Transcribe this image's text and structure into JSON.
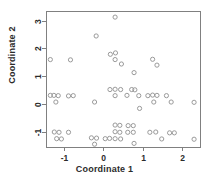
{
  "chart_data": {
    "type": "scatter",
    "title": "",
    "xlabel": "Coordinate 1",
    "ylabel": "Coordinate 2",
    "xlim": [
      -1.45,
      2.45
    ],
    "ylim": [
      -1.55,
      3.35
    ],
    "xticks": [
      -1,
      0,
      1,
      2
    ],
    "xticklabels": [
      "-1",
      "0",
      "1",
      "2"
    ],
    "yticks": [
      -1,
      0,
      1,
      2,
      3
    ],
    "yticklabels": [
      "-1",
      "0",
      "1",
      "2",
      "3"
    ],
    "grid": false,
    "legend": null,
    "marker": "open-circle",
    "marker_color": "#9a9a9a",
    "n_points": 61,
    "points": [
      [
        0.3,
        3.13
      ],
      [
        -0.18,
        2.45
      ],
      [
        0.18,
        1.79
      ],
      [
        0.31,
        1.84
      ],
      [
        0.3,
        1.6
      ],
      [
        0.46,
        1.44
      ],
      [
        -1.34,
        1.6
      ],
      [
        -0.83,
        1.59
      ],
      [
        1.25,
        1.61
      ],
      [
        1.36,
        1.4
      ],
      [
        0.78,
        1.13
      ],
      [
        0.3,
        0.53
      ],
      [
        0.44,
        0.52
      ],
      [
        0.3,
        0.3
      ],
      [
        0.72,
        0.52
      ],
      [
        0.8,
        0.51
      ],
      [
        0.9,
        0.3
      ],
      [
        1.25,
        0.32
      ],
      [
        1.36,
        0.31
      ],
      [
        1.28,
        0.07
      ],
      [
        1.6,
        0.3
      ],
      [
        1.72,
        0.07
      ],
      [
        2.3,
        0.06
      ],
      [
        -1.25,
        0.31
      ],
      [
        -1.14,
        0.3
      ],
      [
        -0.88,
        0.29
      ],
      [
        -0.76,
        0.3
      ],
      [
        -1.2,
        0.07
      ],
      [
        -0.22,
        0.07
      ],
      [
        0.92,
        -0.16
      ],
      [
        0.3,
        -0.76
      ],
      [
        0.42,
        -0.77
      ],
      [
        0.3,
        -1.0
      ],
      [
        0.42,
        -1.02
      ],
      [
        0.3,
        -1.25
      ],
      [
        0.44,
        -1.26
      ],
      [
        0.63,
        -0.78
      ],
      [
        0.76,
        -0.78
      ],
      [
        0.76,
        -1.02
      ],
      [
        0.78,
        -1.42
      ],
      [
        -1.24,
        -1.01
      ],
      [
        -1.12,
        -1.02
      ],
      [
        -0.88,
        -1.02
      ],
      [
        -1.18,
        -1.25
      ],
      [
        -1.06,
        -1.26
      ],
      [
        -0.3,
        -1.22
      ],
      [
        -0.17,
        -1.23
      ],
      [
        -0.22,
        -1.45
      ],
      [
        1.18,
        -1.02
      ],
      [
        1.48,
        -1.26
      ],
      [
        1.68,
        -1.04
      ],
      [
        1.8,
        -1.04
      ],
      [
        2.3,
        -1.27
      ],
      [
        0.62,
        -1.02
      ],
      [
        0.17,
        0.52
      ],
      [
        1.13,
        0.3
      ],
      [
        -1.34,
        0.31
      ],
      [
        0.6,
        0.31
      ],
      [
        1.33,
        -1.01
      ],
      [
        0.16,
        -1.24
      ],
      [
        0.05,
        -1.25
      ]
    ]
  },
  "plot_box": {
    "left": 46,
    "top": 11,
    "right": 200,
    "bottom": 147
  }
}
